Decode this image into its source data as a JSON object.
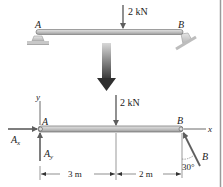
{
  "diagram": {
    "top": {
      "point_a_label": "A",
      "point_b_label": "B",
      "load_label": "2 kN"
    },
    "fbd": {
      "point_a_label": "A",
      "point_b_label": "B",
      "load_label": "2 kN",
      "reaction_ax_label": "A",
      "reaction_ax_sub": "x",
      "reaction_ay_label": "A",
      "reaction_ay_sub": "y",
      "reaction_b_label": "B",
      "axis_x_label": "x",
      "axis_y_label": "y",
      "angle_label": "30°",
      "dim_left_label": "3 m",
      "dim_right_label": "2 m"
    },
    "colors": {
      "beam_fill": "#c9c9c9",
      "beam_stroke": "#6e6e6e",
      "arrow": "#6a6a6a",
      "support": "#bdbdbd",
      "text": "#222222"
    }
  }
}
